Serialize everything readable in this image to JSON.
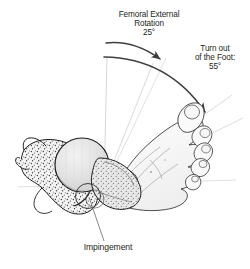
{
  "figure": {
    "type": "anatomical-diagram",
    "background_color": "#ffffff",
    "line_color": "#231f20",
    "guide_line_color": "#bdbdbd",
    "bone_fill": "#f2f2f2",
    "femoral_head_fill": "#e3e3e3",
    "skin_fill": "#fbfbfb"
  },
  "labels": {
    "femoral_rotation": {
      "text": "Femoral External\nRotation\n25°",
      "value": 25,
      "unit": "degrees"
    },
    "turnout_foot": {
      "text": "Turn out\nof the Foot:\n55°",
      "value": 55,
      "unit": "degrees"
    },
    "impingement": {
      "text": "Impingement"
    }
  },
  "annotations": {
    "inner_arc_name": "femoral-external-rotation-arc",
    "outer_arc_name": "foot-turnout-arc",
    "vertex_name": "hip-joint-center",
    "leader_name": "impingement-leader-line"
  },
  "anatomy": [
    {
      "name": "pelvis-ilium",
      "label": "Ilium"
    },
    {
      "name": "acetabulum",
      "label": "Acetabulum"
    },
    {
      "name": "femoral-head",
      "label": "Femoral head"
    },
    {
      "name": "femoral-neck",
      "label": "Femoral neck"
    },
    {
      "name": "greater-trochanter",
      "label": "Greater trochanter"
    },
    {
      "name": "foot",
      "label": "Foot"
    }
  ]
}
